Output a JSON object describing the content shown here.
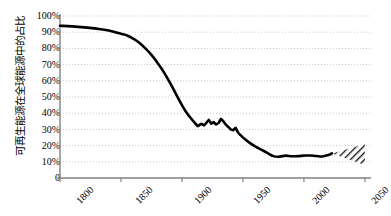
{
  "chart_data": {
    "type": "line",
    "title": "",
    "xlabel": "",
    "ylabel": "可再生能源在全球能源中的占比",
    "xlim": [
      1800,
      2055
    ],
    "ylim": [
      0,
      100
    ],
    "grid": true,
    "legend": "none",
    "y_ticklabels": [
      "100%",
      "90%",
      "80%",
      "70%",
      "60%",
      "50%",
      "40%",
      "30%",
      "20%",
      "10%",
      "0"
    ],
    "y_tickvalues": [
      100,
      90,
      80,
      70,
      60,
      50,
      40,
      30,
      20,
      10,
      0
    ],
    "x_ticklabels": [
      "1800",
      "1850",
      "1900",
      "1950",
      "2000",
      "2050"
    ],
    "x_tickvalues": [
      1800,
      1850,
      1900,
      1950,
      2000,
      2050
    ],
    "series": [
      {
        "name": "可再生能源占比",
        "color": "#000000",
        "x": [
          1800,
          1810,
          1820,
          1830,
          1840,
          1850,
          1855,
          1860,
          1865,
          1870,
          1875,
          1880,
          1885,
          1890,
          1895,
          1900,
          1905,
          1910,
          1913,
          1916,
          1918,
          1920,
          1922,
          1924,
          1926,
          1928,
          1930,
          1932,
          1934,
          1936,
          1938,
          1940,
          1942,
          1944,
          1946,
          1948,
          1950,
          1955,
          1960,
          1965,
          1970,
          1975,
          1980,
          1985,
          1990,
          1995,
          2000,
          2005,
          2010,
          2015,
          2020,
          2023
        ],
        "values": [
          94,
          93.6,
          93,
          92.2,
          91,
          89,
          88,
          86,
          83.5,
          80,
          76,
          71,
          65.5,
          59,
          52,
          45,
          39,
          34.5,
          32,
          33.5,
          32.5,
          34,
          36,
          33.5,
          34.5,
          33,
          34,
          36.5,
          35,
          33,
          31.5,
          30,
          29.5,
          31,
          28,
          26.5,
          25,
          22,
          19.5,
          17.5,
          15.5,
          13.5,
          13.2,
          13.8,
          13.4,
          13.5,
          13.8,
          13.9,
          13.6,
          13.3,
          14.2,
          15.2
        ]
      }
    ],
    "projection": {
      "name": "预测区间",
      "style": "hatched-wedge",
      "x_start": 2023,
      "x_end": 2050,
      "y_start": 15.2,
      "y_high_end": 21,
      "y_low_end": 8
    }
  },
  "axes": {
    "axis_color": "#808080",
    "grid_color": "#c8c8c8",
    "grid_style": "dashed"
  }
}
